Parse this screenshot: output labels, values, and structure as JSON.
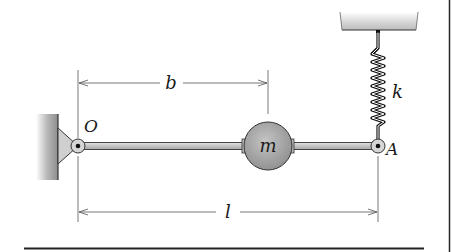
{
  "diagram": {
    "type": "mechanical-system",
    "labels": {
      "pivot_O": "O",
      "end_A": "A",
      "mass": "m",
      "spring": "k",
      "dim_b": "b",
      "dim_l": "l"
    },
    "colors": {
      "ink": "#1a1a1a",
      "rod_fill": "#c8c8c8",
      "mass_fill": "#a9a9a9",
      "wall_fill": "#9a9a9a",
      "ceiling_fill": "#d9d9d9",
      "dim_line": "#555555",
      "border": "#222222"
    }
  }
}
